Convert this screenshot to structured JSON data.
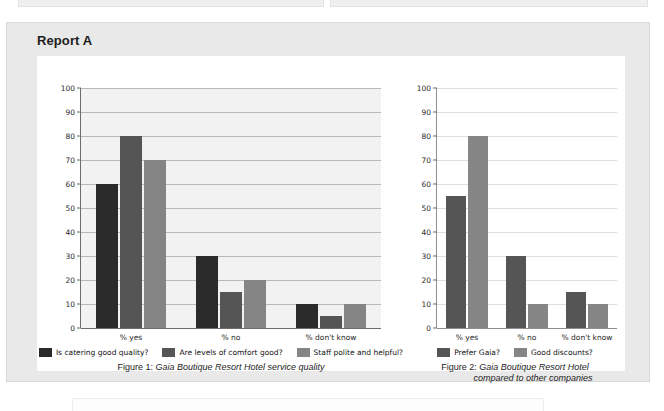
{
  "report": {
    "title": "Report A"
  },
  "colors": {
    "series_dark": "#2b2b2b",
    "series_mid": "#555555",
    "series_light": "#858585",
    "card_bg": "#e9e9e9",
    "plot_bg_left": "#f2f2f2",
    "gridline_left": "#b9b9b9",
    "gridline_right": "#dedede"
  },
  "chart_data": [
    {
      "type": "bar",
      "id": "figure-1",
      "title": "",
      "xlabel": "",
      "ylabel": "",
      "categories": [
        "% yes",
        "% no",
        "% don't know"
      ],
      "yticks": [
        0,
        10,
        20,
        30,
        40,
        50,
        60,
        70,
        80,
        90,
        100
      ],
      "ylim": [
        0,
        100
      ],
      "grid": true,
      "legend_position": "bottom",
      "series": [
        {
          "name": "Is catering good quality?",
          "color": "#2b2b2b",
          "values": [
            60,
            30,
            10
          ]
        },
        {
          "name": "Are levels of comfort good?",
          "color": "#555555",
          "values": [
            80,
            15,
            5
          ]
        },
        {
          "name": "Staff polite and helpful?",
          "color": "#858585",
          "values": [
            70,
            20,
            10
          ]
        }
      ],
      "caption_prefix": "Figure 1:",
      "caption_text": "Gaia Boutique Resort Hotel service quality"
    },
    {
      "type": "bar",
      "id": "figure-2",
      "title": "",
      "xlabel": "",
      "ylabel": "",
      "categories": [
        "% yes",
        "% no",
        "% don't know"
      ],
      "yticks": [
        0,
        10,
        20,
        30,
        40,
        50,
        60,
        70,
        80,
        90,
        100
      ],
      "ylim": [
        0,
        100
      ],
      "grid": true,
      "legend_position": "bottom",
      "series": [
        {
          "name": "Prefer Gaia?",
          "color": "#555555",
          "values": [
            55,
            30,
            15
          ]
        },
        {
          "name": "Good discounts?",
          "color": "#858585",
          "values": [
            80,
            10,
            10
          ]
        }
      ],
      "caption_prefix": "Figure 2:",
      "caption_text": "Gaia Boutique Resort Hotel",
      "caption_text2": "compared to other companies"
    }
  ]
}
